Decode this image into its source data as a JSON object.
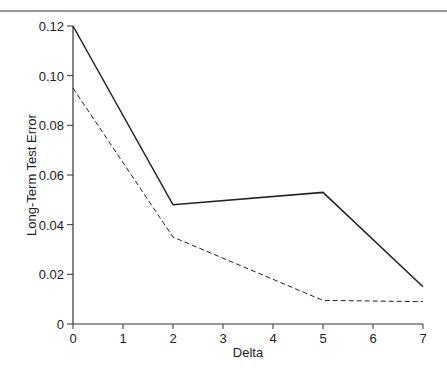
{
  "chart_data": {
    "type": "line",
    "title": "",
    "xlabel": "Delta",
    "ylabel": "Long-Term Test Error",
    "xlim": [
      0,
      7
    ],
    "ylim": [
      0,
      0.12
    ],
    "x_ticks": [
      "0",
      "1",
      "2",
      "3",
      "4",
      "5",
      "6",
      "7"
    ],
    "y_ticks": [
      "0",
      "0.02",
      "0.04",
      "0.06",
      "0.08",
      "0.10",
      "0.12"
    ],
    "grid": false,
    "legend": null,
    "series": [
      {
        "name": "solid",
        "style": "solid",
        "x": [
          0,
          2,
          5,
          7
        ],
        "values": [
          0.12,
          0.048,
          0.053,
          0.015
        ]
      },
      {
        "name": "dashed",
        "style": "dashed",
        "x": [
          0,
          2,
          5,
          7
        ],
        "values": [
          0.095,
          0.035,
          0.0095,
          0.009
        ]
      }
    ]
  }
}
